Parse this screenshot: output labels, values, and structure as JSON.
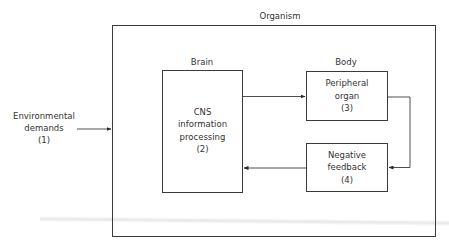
{
  "diagram": {
    "type": "block-diagram",
    "outer": {
      "title": "Organism"
    },
    "input": {
      "lines": [
        "Environmental",
        "demands",
        "(1)"
      ]
    },
    "sections": {
      "brain_label": "Brain",
      "body_label": "Body"
    },
    "nodes": [
      {
        "id": "cns",
        "lines": [
          "CNS",
          "information",
          "processing",
          "(2)"
        ]
      },
      {
        "id": "peripheral",
        "lines": [
          "Peripheral",
          "organ",
          "(3)"
        ]
      },
      {
        "id": "feedback",
        "lines": [
          "Negative",
          "feedback",
          "(4)"
        ]
      }
    ],
    "edges": [
      {
        "from": "environmental-demands",
        "to": "organism"
      },
      {
        "from": "cns",
        "to": "peripheral"
      },
      {
        "from": "peripheral",
        "to": "feedback"
      },
      {
        "from": "feedback",
        "to": "cns"
      }
    ],
    "colors": {
      "line": "#3a3a3a",
      "text": "#333333",
      "background": "#ffffff"
    }
  }
}
